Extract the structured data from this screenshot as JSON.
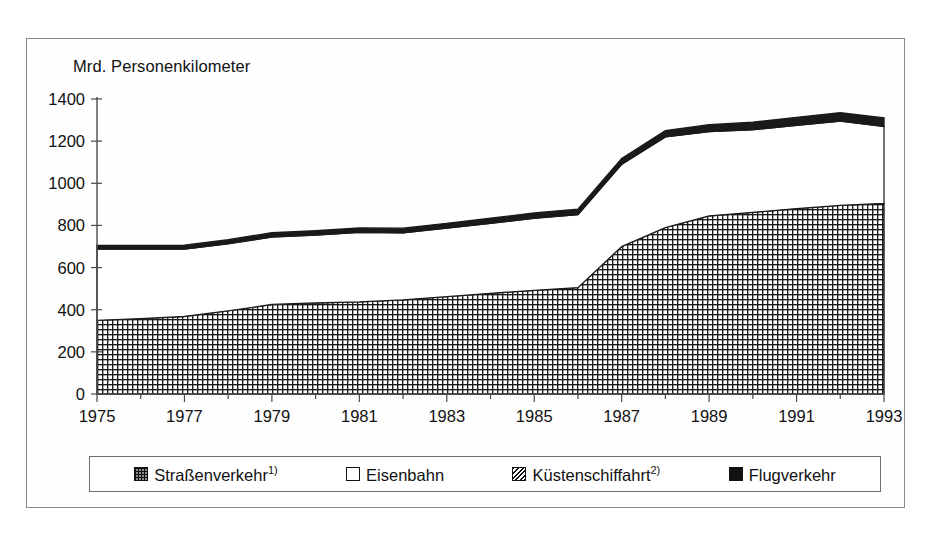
{
  "figure": {
    "axis_title": "Mrd. Personenkilometer"
  },
  "legend": {
    "items": [
      {
        "label": "Straßenverkehr",
        "footnote": "1)",
        "swatch": "grid-pattern-swatch",
        "color": "#8c8c8c"
      },
      {
        "label": "Eisenbahn",
        "footnote": "",
        "swatch": "white-swatch",
        "color": "#ffffff"
      },
      {
        "label": "Küstenschiffahrt",
        "footnote": "2)",
        "swatch": "diagonal-hatch-swatch",
        "color": "#c9c9c9"
      },
      {
        "label": "Flugverkehr",
        "footnote": "",
        "swatch": "black-swatch",
        "color": "#111111"
      }
    ]
  },
  "chart_data": {
    "type": "area",
    "stacked": true,
    "title": "",
    "subtitle": "",
    "xlabel": "",
    "ylabel": "Mrd. Personenkilometer",
    "xlim": [
      1975,
      1993
    ],
    "ylim": [
      0,
      1400
    ],
    "ytick_step": 200,
    "yticks": [
      0,
      200,
      400,
      600,
      800,
      1000,
      1200,
      1400
    ],
    "ytick_labels": [
      "0",
      "200",
      "400",
      "600",
      "800",
      "1000",
      "1200",
      "1400"
    ],
    "xticks": [
      1975,
      1977,
      1979,
      1981,
      1983,
      1985,
      1987,
      1989,
      1991,
      1993
    ],
    "xtick_labels": [
      "1975",
      "1977",
      "1979",
      "1981",
      "1983",
      "1985",
      "1987",
      "1989",
      "1991",
      "1993"
    ],
    "x": [
      1975,
      1976,
      1977,
      1978,
      1979,
      1980,
      1981,
      1982,
      1983,
      1984,
      1985,
      1986,
      1987,
      1988,
      1989,
      1990,
      1991,
      1992,
      1993
    ],
    "grid": false,
    "legend_position": "bottom",
    "series": [
      {
        "name": "Straßenverkehr",
        "pattern": "grid",
        "values": [
          350,
          358,
          368,
          395,
          425,
          432,
          437,
          447,
          462,
          478,
          492,
          505,
          700,
          790,
          845,
          862,
          880,
          895,
          905
        ]
      },
      {
        "name": "Eisenbahn",
        "pattern": "white",
        "values": [
          338,
          330,
          320,
          318,
          320,
          322,
          330,
          318,
          325,
          332,
          342,
          346,
          390,
          430,
          400,
          392,
          395,
          400,
          365
        ]
      },
      {
        "name": "Küstenschiffahrt",
        "pattern": "hatch",
        "values": [
          0,
          0,
          0,
          0,
          0,
          0,
          0,
          0,
          0,
          0,
          0,
          0,
          0,
          0,
          0,
          0,
          0,
          0,
          0
        ]
      },
      {
        "name": "Flugverkehr",
        "pattern": "black",
        "values": [
          17,
          17,
          18,
          19,
          20,
          21,
          21,
          22,
          23,
          24,
          25,
          26,
          27,
          30,
          33,
          36,
          38,
          40,
          40
        ]
      }
    ],
    "totals": [
      705,
      705,
      706,
      732,
      765,
      775,
      788,
      787,
      810,
      834,
      859,
      877,
      1117,
      1250,
      1278,
      1290,
      1313,
      1335,
      1310
    ]
  }
}
